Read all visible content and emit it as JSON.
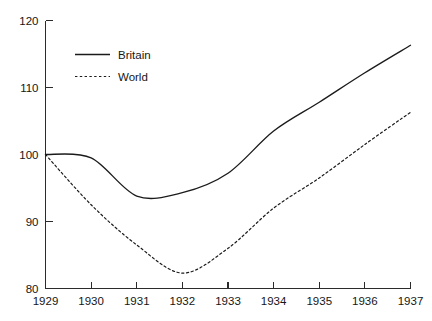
{
  "chart_data": {
    "type": "line",
    "title": "",
    "subtitle": "",
    "xlabel": "",
    "ylabel": "",
    "x": [
      1929,
      1930,
      1931,
      1932,
      1933,
      1934,
      1935,
      1936,
      1937
    ],
    "xtick_labels": [
      "1929",
      "1930",
      "1931",
      "1932",
      "1933",
      "1934",
      "1935",
      "1936",
      "1937"
    ],
    "ytick_labels": [
      "80",
      "90",
      "100",
      "110",
      "120"
    ],
    "ytick_values": [
      80,
      90,
      100,
      110,
      120
    ],
    "xlim": [
      1929,
      1937
    ],
    "ylim": [
      80,
      120
    ],
    "grid": false,
    "legend_position": "upper-left",
    "series": [
      {
        "name": "Britain",
        "style": "solid",
        "color": "#1b1b1b",
        "values": [
          100.0,
          99.5,
          93.8,
          94.3,
          97.2,
          103.5,
          107.8,
          112.2,
          116.3
        ]
      },
      {
        "name": "World",
        "style": "dashed",
        "color": "#1b1b1b",
        "values": [
          100.0,
          92.5,
          86.5,
          82.3,
          86.0,
          92.0,
          96.5,
          101.5,
          106.3
        ]
      }
    ]
  },
  "legend": {
    "entries": [
      {
        "label": "Britain"
      },
      {
        "label": "World"
      }
    ]
  },
  "axes": {
    "y_axis_name": "index-value-axis",
    "x_axis_name": "year-axis"
  }
}
